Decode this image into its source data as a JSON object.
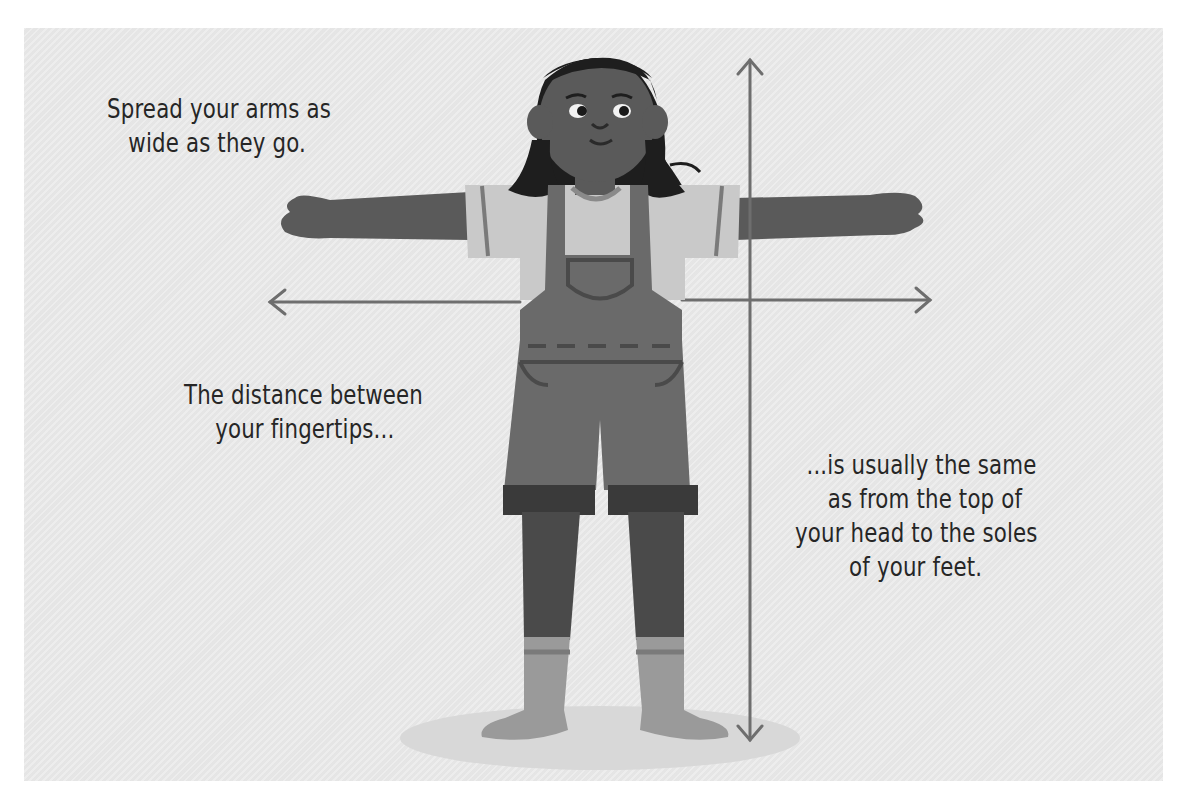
{
  "illustration": {
    "subject": "girl with arms spread wide standing on floor",
    "icons": [
      "horizontal-double-arrow-icon",
      "vertical-double-arrow-icon"
    ],
    "colors": {
      "background": "#e9e9e9",
      "panel_border": "#ffffff",
      "skin": "#5a5a5a",
      "hair": "#1e1e1e",
      "overalls": "#6a6a6a",
      "shirt": "#c9c9c9",
      "socks": "#9a9a9a",
      "arrow": "#6e6e6e",
      "text": "#262626",
      "floor_shadow": "#d6d6d6"
    }
  },
  "captions": {
    "top_left": {
      "line1": "Spread your arms as",
      "line2": "wide as they go."
    },
    "middle_left": {
      "line1": "The distance between",
      "line2": "your fingertips..."
    },
    "right": {
      "line1": "...is usually the same",
      "line2": "as from the top of",
      "line3": "your head to the soles",
      "line4": "of your feet."
    }
  }
}
